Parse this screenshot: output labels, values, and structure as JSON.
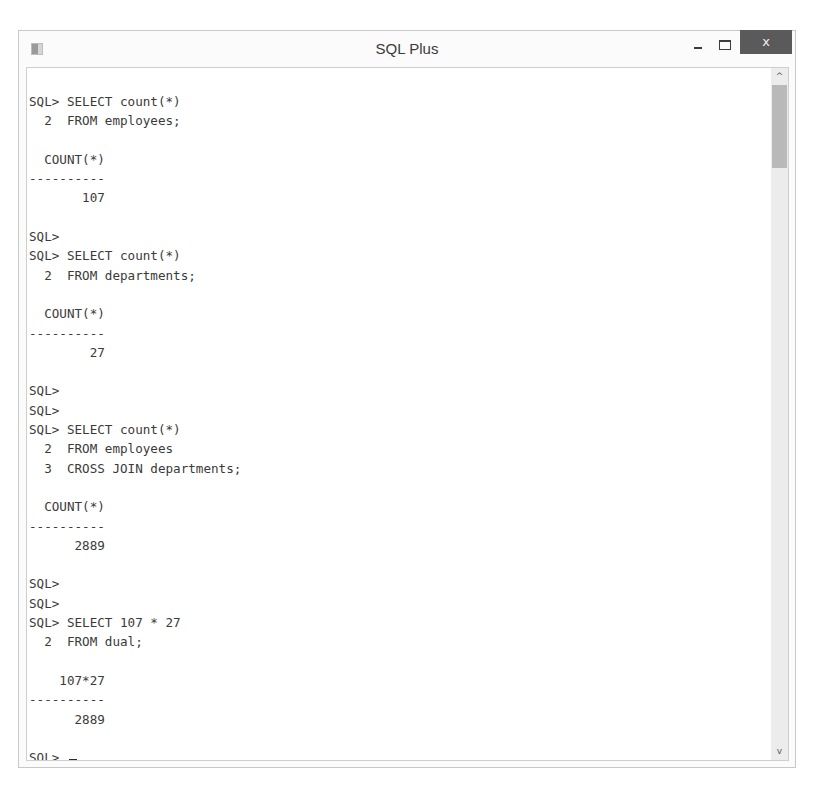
{
  "window": {
    "title": "SQL Plus",
    "controls": {
      "minimize_icon": "minimize-icon",
      "maximize_icon": "maximize-icon",
      "close_label": "x"
    },
    "app_icon": "sqlplus-app-icon"
  },
  "scrollbar": {
    "up_glyph": "^",
    "down_glyph": "v",
    "thumb_position": "top"
  },
  "console": {
    "lines": [
      "SQL> SELECT count(*)",
      "  2  FROM employees;",
      "",
      "  COUNT(*)",
      "----------",
      "       107",
      "",
      "SQL>",
      "SQL> SELECT count(*)",
      "  2  FROM departments;",
      "",
      "  COUNT(*)",
      "----------",
      "        27",
      "",
      "SQL>",
      "SQL>",
      "SQL> SELECT count(*)",
      "  2  FROM employees",
      "  3  CROSS JOIN departments;",
      "",
      "  COUNT(*)",
      "----------",
      "      2889",
      "",
      "SQL>",
      "SQL>",
      "SQL> SELECT 107 * 27",
      "  2  FROM dual;",
      "",
      "    107*27",
      "----------",
      "      2889",
      "",
      "SQL> "
    ],
    "prompt": "SQL>",
    "cursor": "_"
  }
}
